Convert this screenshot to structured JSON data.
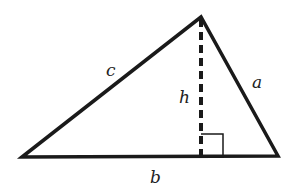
{
  "diagram": {
    "type": "triangle-with-altitude",
    "labels": {
      "side_a": "a",
      "side_b": "b",
      "side_c": "c",
      "height": "h"
    },
    "colors": {
      "stroke": "#1a1a1a",
      "background": "#ffffff"
    }
  }
}
